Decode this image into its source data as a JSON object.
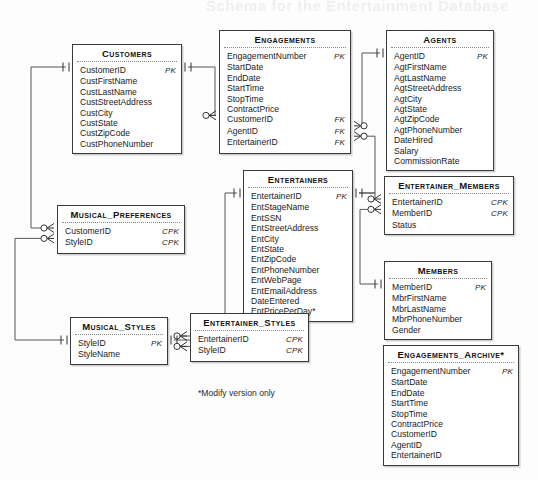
{
  "diagram": {
    "footnote": "*Modify version only",
    "bleed_title": "Schema for the Entertainment Database",
    "line_color": "#555555",
    "box_border_color": "#3a3a3a"
  },
  "entities": [
    {
      "id": "customers",
      "name": "Customers",
      "x": 72,
      "y": 44,
      "w": 110,
      "attrs": [
        {
          "name": "CustomerID",
          "key": "PK"
        },
        {
          "name": "CustFirstName",
          "key": ""
        },
        {
          "name": "CustLastName",
          "key": ""
        },
        {
          "name": "CustStreetAddress",
          "key": ""
        },
        {
          "name": "CustCity",
          "key": ""
        },
        {
          "name": "CustState",
          "key": ""
        },
        {
          "name": "CustZipCode",
          "key": ""
        },
        {
          "name": "CustPhoneNumber",
          "key": ""
        }
      ]
    },
    {
      "id": "engagements",
      "name": "Engagements",
      "x": 219,
      "y": 30,
      "w": 132,
      "attrs": [
        {
          "name": "EngagementNumber",
          "key": "PK"
        },
        {
          "name": "StartDate",
          "key": ""
        },
        {
          "name": "EndDate",
          "key": ""
        },
        {
          "name": "StartTime",
          "key": ""
        },
        {
          "name": "StopTime",
          "key": ""
        },
        {
          "name": "ContractPrice",
          "key": ""
        },
        {
          "name": "CustomerID",
          "key": "FK"
        },
        {
          "name": "AgentID",
          "key": "FK"
        },
        {
          "name": "EntertainerID",
          "key": "FK"
        }
      ]
    },
    {
      "id": "agents",
      "name": "Agents",
      "x": 386,
      "y": 30,
      "w": 108,
      "attrs": [
        {
          "name": "AgentID",
          "key": "PK"
        },
        {
          "name": "AgtFirstName",
          "key": ""
        },
        {
          "name": "AgtLastName",
          "key": ""
        },
        {
          "name": "AgtStreetAddress",
          "key": ""
        },
        {
          "name": "AgtCity",
          "key": ""
        },
        {
          "name": "AgtState",
          "key": ""
        },
        {
          "name": "AgtZipCode",
          "key": ""
        },
        {
          "name": "AgtPhoneNumber",
          "key": ""
        },
        {
          "name": "DateHired",
          "key": ""
        },
        {
          "name": "Salary",
          "key": ""
        },
        {
          "name": "CommissionRate",
          "key": ""
        }
      ]
    },
    {
      "id": "entertainers",
      "name": "Entertainers",
      "x": 243,
      "y": 170,
      "w": 110,
      "attrs": [
        {
          "name": "EntertainerID",
          "key": "PK"
        },
        {
          "name": "EntStageName",
          "key": ""
        },
        {
          "name": "EntSSN",
          "key": ""
        },
        {
          "name": "EntStreetAddress",
          "key": ""
        },
        {
          "name": "EntCity",
          "key": ""
        },
        {
          "name": "EntState",
          "key": ""
        },
        {
          "name": "EntZipCode",
          "key": ""
        },
        {
          "name": "EntPhoneNumber",
          "key": ""
        },
        {
          "name": "EntWebPage",
          "key": ""
        },
        {
          "name": "EntEmailAddress",
          "key": ""
        },
        {
          "name": "DateEntered",
          "key": ""
        },
        {
          "name": "EntPricePerDay*",
          "key": ""
        }
      ]
    },
    {
      "id": "musical_preferences",
      "name": "Musical_Preferences",
      "x": 57,
      "y": 205,
      "w": 128,
      "attrs": [
        {
          "name": "CustomerID",
          "key": "CPK"
        },
        {
          "name": "StyleID",
          "key": "CPK"
        }
      ]
    },
    {
      "id": "musical_styles",
      "name": "Musical_Styles",
      "x": 70,
      "y": 317,
      "w": 98,
      "attrs": [
        {
          "name": "StyleID",
          "key": "PK"
        },
        {
          "name": "StyleName",
          "key": ""
        }
      ]
    },
    {
      "id": "entertainer_members",
      "name": "Entertainer_Members",
      "x": 384,
      "y": 176,
      "w": 130,
      "attrs": [
        {
          "name": "EntertainerID",
          "key": "CPK"
        },
        {
          "name": "MemberID",
          "key": "CPK"
        },
        {
          "name": "Status",
          "key": ""
        }
      ]
    },
    {
      "id": "members",
      "name": "Members",
      "x": 384,
      "y": 261,
      "w": 108,
      "attrs": [
        {
          "name": "MemberID",
          "key": "PK"
        },
        {
          "name": "MbrFirstName",
          "key": ""
        },
        {
          "name": "MbrLastName",
          "key": ""
        },
        {
          "name": "MbrPhoneNumber",
          "key": ""
        },
        {
          "name": "Gender",
          "key": ""
        }
      ]
    },
    {
      "id": "entertainer_styles",
      "name": "Entertainer_Styles",
      "x": 190,
      "y": 313,
      "w": 119,
      "attrs": [
        {
          "name": "EntertainerID",
          "key": "CPK"
        },
        {
          "name": "StyleID",
          "key": "CPK"
        }
      ]
    },
    {
      "id": "engagements_archive",
      "name": "Engagements_Archive*",
      "x": 383,
      "y": 345,
      "w": 136,
      "attrs": [
        {
          "name": "EngagementNumber",
          "key": "PK"
        },
        {
          "name": "StartDate",
          "key": ""
        },
        {
          "name": "EndDate",
          "key": ""
        },
        {
          "name": "StartTime",
          "key": ""
        },
        {
          "name": "StopTime",
          "key": ""
        },
        {
          "name": "ContractPrice",
          "key": ""
        },
        {
          "name": "CustomerID",
          "key": ""
        },
        {
          "name": "AgentID",
          "key": ""
        },
        {
          "name": "EntertainerID",
          "key": ""
        }
      ]
    }
  ],
  "relationships": [
    {
      "id": "customers-engagements",
      "from": "Customers",
      "to": "Engagements",
      "from_card": "one-mandatory",
      "to_card": "zero-many"
    },
    {
      "id": "agents-engagements",
      "from": "Agents",
      "to": "Engagements",
      "from_card": "one-mandatory",
      "to_card": "zero-many"
    },
    {
      "id": "entertainers-engagements",
      "from": "Entertainers",
      "to": "Engagements",
      "from_card": "one-mandatory",
      "to_card": "zero-many"
    },
    {
      "id": "customers-musical-preferences",
      "from": "Customers",
      "to": "Musical_Preferences",
      "from_card": "one-mandatory",
      "to_card": "zero-many"
    },
    {
      "id": "musical-styles-musical-preferences",
      "from": "Musical_Styles",
      "to": "Musical_Preferences",
      "from_card": "one-mandatory",
      "to_card": "zero-many"
    },
    {
      "id": "entertainers-entertainer-members",
      "from": "Entertainers",
      "to": "Entertainer_Members",
      "from_card": "one-mandatory",
      "to_card": "zero-many"
    },
    {
      "id": "members-entertainer-members",
      "from": "Members",
      "to": "Entertainer_Members",
      "from_card": "one-mandatory",
      "to_card": "zero-many"
    },
    {
      "id": "entertainers-entertainer-styles",
      "from": "Entertainers",
      "to": "Entertainer_Styles",
      "from_card": "one-mandatory",
      "to_card": "zero-many"
    },
    {
      "id": "musical-styles-entertainer-styles",
      "from": "Musical_Styles",
      "to": "Entertainer_Styles",
      "from_card": "one-mandatory",
      "to_card": "zero-many"
    }
  ]
}
